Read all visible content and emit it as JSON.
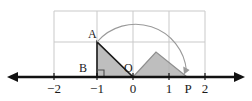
{
  "figure": {
    "kind": "number-line-geometry-diagram",
    "colors": {
      "axis": "#111111",
      "grid": "#c9c9c9",
      "shape_fill": "#b3b3b3",
      "shape_stroke": "#4d4d4d",
      "triangle_outline": "#1a1a1a",
      "arc": "#8a8a8a",
      "label": "#1a1a1a",
      "background": "#ffffff"
    },
    "axis": {
      "name": "number-line",
      "y_pixel": 77,
      "x_start_pixel": 8,
      "x_end_pixel": 244,
      "arrow_both_ends": true,
      "ticks": [
        {
          "value": -2,
          "label": "−2",
          "x_pixel": 54
        },
        {
          "value": -1,
          "label": "−1",
          "x_pixel": 97
        },
        {
          "value": 0,
          "label": "0",
          "x_pixel": 133
        },
        {
          "value": 1,
          "label": "1",
          "x_pixel": 169
        },
        {
          "value": 1.38,
          "label": "P",
          "x_pixel": 187
        },
        {
          "value": 2,
          "label": "2",
          "x_pixel": 205
        }
      ]
    },
    "grid": {
      "name": "background-grid",
      "left_pixel": 54,
      "right_pixel": 205,
      "top_pixel": 11,
      "bottom_pixel": 77,
      "vertical_lines_x": [
        54,
        97,
        133,
        169,
        205
      ],
      "horizontal_lines_y": [
        11,
        42,
        77
      ],
      "columns": 4,
      "rows": 2
    },
    "points": [
      {
        "id": "A",
        "label": "A",
        "x_pixel": 97,
        "y_pixel": 42,
        "label_x": 88,
        "label_y": 29
      },
      {
        "id": "B",
        "label": "B",
        "x_pixel": 97,
        "y_pixel": 77,
        "label_x": 79,
        "label_y": 63
      },
      {
        "id": "O",
        "label": "O",
        "x_pixel": 133,
        "y_pixel": 77,
        "label_x": 125,
        "label_y": 63
      },
      {
        "id": "P",
        "label": "P",
        "x_pixel": 187,
        "y_pixel": 77,
        "label_x": 187,
        "label_y": 84
      }
    ],
    "shapes": {
      "triangle_ABO": {
        "name": "right-triangle-abo",
        "points_pixel": "97,42 97,77 133,77",
        "has_right_angle_at": "B"
      },
      "triangle_OMP": {
        "name": "triangle-omp",
        "points_pixel": "133,77 156,52 187,77"
      },
      "right_angle_marker": {
        "name": "right-angle-marker-b",
        "x_pixel": 97,
        "y_pixel": 77,
        "size_pixel": 7
      },
      "arc": {
        "name": "rotation-arc",
        "from_pixel": [
          97,
          42
        ],
        "to_pixel": [
          187,
          77
        ],
        "radius_pixel": 51,
        "has_arrow_head_at_end": true
      }
    }
  }
}
